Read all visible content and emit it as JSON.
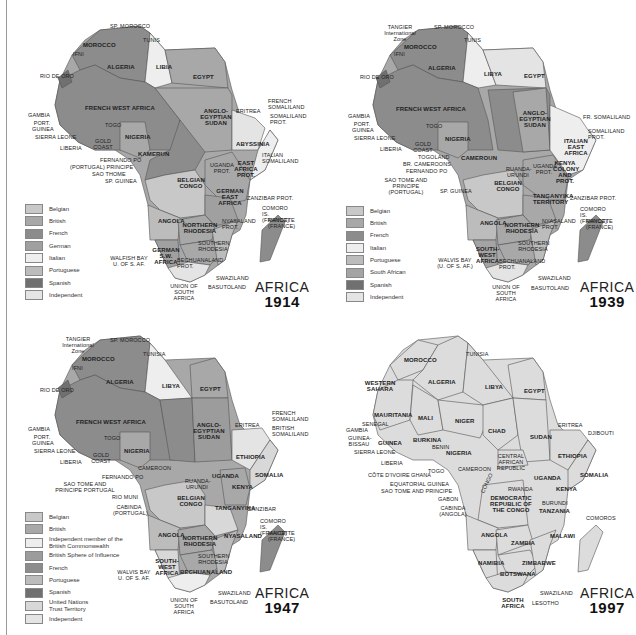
{
  "maps": [
    {
      "id": "1914",
      "title": "AFRICA",
      "year": "1914",
      "legend": [
        {
          "label": "Belgian",
          "color": "#c8c8c8"
        },
        {
          "label": "British",
          "color": "#a8a8a8"
        },
        {
          "label": "French",
          "color": "#8c8c8c"
        },
        {
          "label": "German",
          "color": "#a0a0a0"
        },
        {
          "label": "Italian",
          "color": "#eeeeee"
        },
        {
          "label": "Portuguese",
          "color": "#bcbcbc"
        },
        {
          "label": "Spanish",
          "color": "#707070"
        },
        {
          "label": "Independent",
          "color": "#e4e4e4"
        }
      ],
      "labels": [
        "SP. MOROCCO",
        "TUNIS",
        "MOROCCO",
        "IFNI",
        "ALGERIA",
        "LIBIA",
        "EGYPT",
        "RIO DE ORO",
        "FRENCH WEST AFRICA",
        "ANGLO-EGYPTIAN SUDAN",
        "ERITREA",
        "FRENCH SOMALILAND",
        "SOMALILAND PROT.",
        "GAMBIA",
        "PORT. GUINEA",
        "SIERRA LEONE",
        "TOGO",
        "GOLD COAST",
        "NIGERIA",
        "LIBERIA",
        "KAMERUN",
        "FRENCH EQUATORIAL AFRICA",
        "ABYSSINIA",
        "ITALIAN SOMALILAND",
        "FERNANDO PO",
        "(PORTUGAL) PRINCIPE",
        "SAO THOME",
        "SP. GUINEA",
        "UGANDA PROT.",
        "EAST AFRICA PROT.",
        "BELGIAN CONGO",
        "GERMAN EAST AFRICA",
        "ZANZIBAR PROT.",
        "COMORO IS. (FRANCE)",
        "MAYOTTE (FRANCE)",
        "ANGOLA",
        "NORTHERN RHODESIA",
        "NYASALAND PROT.",
        "SOUTHERN RHODESIA",
        "MOZAMBIQUE",
        "MADAGASCAR",
        "GERMAN S.W. AFRICA",
        "WALFISH BAY U. of S. Af.",
        "BECHUANALAND PROT.",
        "SWAZILAND",
        "BASUTOLAND",
        "UNION OF SOUTH AFRICA"
      ]
    },
    {
      "id": "1939",
      "title": "AFRICA",
      "year": "1939",
      "legend": [
        {
          "label": "Belgian",
          "color": "#c8c8c8"
        },
        {
          "label": "British",
          "color": "#a8a8a8"
        },
        {
          "label": "French",
          "color": "#8c8c8c"
        },
        {
          "label": "Italian",
          "color": "#eeeeee"
        },
        {
          "label": "Portuguese",
          "color": "#bcbcbc"
        },
        {
          "label": "South African",
          "color": "#a4a4a4"
        },
        {
          "label": "Spanish",
          "color": "#707070"
        },
        {
          "label": "Independent",
          "color": "#e4e4e4"
        }
      ],
      "labels": [
        "TANGIER International Zone",
        "SP. MOROCCO",
        "TUNIS",
        "MOROCCO",
        "IFNI",
        "ALGERIA",
        "LIBYA",
        "EGYPT",
        "RIO DE ORO",
        "FRENCH WEST AFRICA",
        "ANGLO-EGYPTIAN SUDAN",
        "FR. SOMALILAND",
        "SOMALILAND PROT.",
        "ITALIAN EAST AFRICA",
        "GAMBIA",
        "PORT. GUINEA",
        "SIERRA LEONE",
        "TOGO",
        "GOLD COAST",
        "LIBERIA",
        "NIGERIA",
        "TOGOLAND",
        "BR. CAMEROONS",
        "FERNANDO PO",
        "SAO TOME AND PRINCIPE (PORTUGAL)",
        "SP. GUINEA",
        "CAMEROUN",
        "FRENCH EQUATORIAL AFRICA",
        "RUANDA-URUNDI",
        "UGANDA PROT.",
        "KENYA COLONY AND PROT.",
        "BELGIAN CONGO",
        "TANGANYIKA TERRITORY",
        "ZANZIBAR PROT.",
        "COMORO IS. (FRANCE)",
        "MAYOTTE (FRANCE)",
        "ANGOLA",
        "NORTHERN RHODESIA",
        "NYASALAND PROT.",
        "SOUTHERN RHODESIA",
        "MOZAMBIQUE",
        "MADAGASCAR",
        "SOUTH-WEST AFRICA",
        "WALVIS BAY (U. OF S. AF.)",
        "BECHUANALAND PROT.",
        "SWAZILAND",
        "BASUTOLAND",
        "UNION OF SOUTH AFRICA"
      ]
    },
    {
      "id": "1947",
      "title": "AFRICA",
      "year": "1947",
      "legend": [
        {
          "label": "Belgian",
          "color": "#c8c8c8"
        },
        {
          "label": "British",
          "color": "#a8a8a8"
        },
        {
          "label": "Independent member of the British Commonwealth",
          "color": "#eeeeee"
        },
        {
          "label": "British Sphere of Influence",
          "color": "#9c9c9c"
        },
        {
          "label": "French",
          "color": "#8c8c8c"
        },
        {
          "label": "Portuguese",
          "color": "#bcbcbc"
        },
        {
          "label": "Spanish",
          "color": "#707070"
        },
        {
          "label": "United Nations Trust Territory",
          "color": "#d8d8d8"
        },
        {
          "label": "Independent",
          "color": "#e4e4e4"
        }
      ],
      "labels": [
        "TANGIER International Zone",
        "SP. MOROCCO",
        "TUNISIA",
        "MOROCCO",
        "IFNI",
        "ALGERIA",
        "LIBYA",
        "EGYPT",
        "RIO DE ORO",
        "FRENCH WEST AFRICA",
        "ANGLO-EGYPTIAN SUDAN",
        "ERITREA",
        "FRENCH SOMALILAND",
        "BRITISH SOMALILAND",
        "ETHIOPIA",
        "GAMBIA",
        "PORT. GUINEA",
        "SIERRA LEONE",
        "TOGO",
        "GOLD COAST",
        "LIBERIA",
        "NIGERIA",
        "CAMEROON",
        "FERNANDO PO",
        "SAO TOME AND PRINCIPE PORTUGAL",
        "RIO MUNI",
        "CABINDA (PORTUGAL)",
        "FRENCH EQUATORIAL AFRICA",
        "RUANDA-URUNDI",
        "UGANDA",
        "KENYA",
        "SOMALIA",
        "BELGIAN CONGO",
        "TANGANYIKA",
        "ZANZIBAR",
        "COMORO IS. (FRANCE)",
        "MAYOTTE (FRANCE)",
        "ANGOLA",
        "NORTHERN RHODESIA",
        "NYASALAND",
        "SOUTHERN RHODESIA",
        "MOZAMBIQUE",
        "MADAGASCAR",
        "SOUTH-WEST AFRICA",
        "WALVIS BAY U. OF S. AF.",
        "BECHUANALAND",
        "SWAZILAND",
        "BASUTOLAND",
        "UNION OF SOUTH AFRICA"
      ]
    },
    {
      "id": "1997",
      "title": "AFRICA",
      "year": "1997",
      "legend": [],
      "labels": [
        "TUNISIA",
        "MOROCCO",
        "ALGERIA",
        "LIBYA",
        "EGYPT",
        "WESTERN SAHARA",
        "MAURITANIA",
        "MALI",
        "NIGER",
        "CHAD",
        "SUDAN",
        "ERITREA",
        "DJIBOUTI",
        "SENEGAL",
        "GAMBIA",
        "GUINEA-BISSAU",
        "GUINEA",
        "SIERRA LEONE",
        "BURKINA",
        "BENIN",
        "NIGERIA",
        "ETHIOPIA",
        "LIBERIA",
        "CENTRAL AFRICAN REPUBLIC",
        "CÔTE D'IVOIRE",
        "GHANA",
        "TOGO",
        "CAMEROON",
        "EQUATORIAL GUINEA",
        "SAO TOME AND PRINCIPE",
        "GABON",
        "CONGO",
        "CABINDA (ANGOLA)",
        "UGANDA",
        "KENYA",
        "SOMALIA",
        "RWANDA",
        "BURUNDI",
        "DEMOCRATIC REPUBLIC OF THE CONGO",
        "TANZANIA",
        "COMOROS",
        "ANGOLA",
        "ZAMBIA",
        "MALAWI",
        "MOZAMBIQUE",
        "ZIMBABWE",
        "MADAGASCAR",
        "NAMIBIA",
        "BOTSWANA",
        "SWAZILAND",
        "SOUTH AFRICA",
        "LESOTHO"
      ]
    }
  ]
}
